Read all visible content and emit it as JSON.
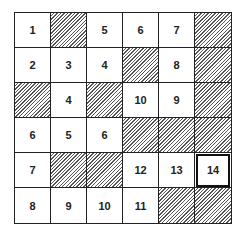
{
  "grid": {
    "rows": 6,
    "cols": 6,
    "cells": [
      [
        {
          "v": "1"
        },
        {
          "h": true
        },
        {
          "v": "5"
        },
        {
          "v": "6"
        },
        {
          "v": "7"
        },
        {
          "h": true
        }
      ],
      [
        {
          "v": "2"
        },
        {
          "v": "3"
        },
        {
          "v": "4"
        },
        {
          "h": true
        },
        {
          "v": "8"
        },
        {
          "h": true
        }
      ],
      [
        {
          "h": true
        },
        {
          "v": "4"
        },
        {
          "h": true
        },
        {
          "v": "10"
        },
        {
          "v": "9"
        },
        {
          "h": true
        }
      ],
      [
        {
          "v": "6"
        },
        {
          "v": "5"
        },
        {
          "v": "6"
        },
        {
          "h": true
        },
        {
          "h": true
        },
        {
          "h": true
        }
      ],
      [
        {
          "v": "7"
        },
        {
          "h": true
        },
        {
          "h": true
        },
        {
          "v": "12"
        },
        {
          "v": "13"
        },
        {
          "v": "14",
          "bold": true
        }
      ],
      [
        {
          "v": "8"
        },
        {
          "v": "9"
        },
        {
          "v": "10"
        },
        {
          "v": "11"
        },
        {
          "h": true
        },
        {
          "h": true
        }
      ]
    ]
  }
}
